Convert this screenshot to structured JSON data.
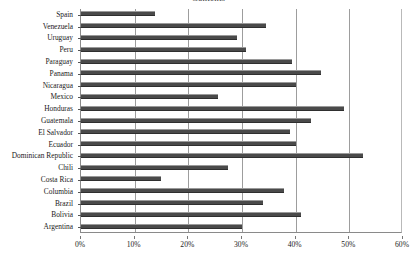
{
  "chart_data": {
    "type": "bar",
    "orientation": "horizontal",
    "title": "Contents",
    "xlabel": "",
    "ylabel": "",
    "xlim": [
      0,
      60
    ],
    "xticks": [
      "0%",
      "10%",
      "20%",
      "30%",
      "40%",
      "50%",
      "60%"
    ],
    "xtick_values": [
      0,
      10,
      20,
      30,
      40,
      50,
      60
    ],
    "grid": true,
    "gridlines_at": [
      10,
      20,
      30,
      40,
      50
    ],
    "legend": null,
    "bar_color": "#4a4a4a",
    "categories": [
      "Spain",
      "Venezuela",
      "Uruguay",
      "Peru",
      "Paraguay",
      "Panama",
      "Nicaragua",
      "Mexico",
      "Honduras",
      "Guatemala",
      "El Salvador",
      "Ecuador",
      "Dominican Republic",
      "Chili",
      "Costa Rica",
      "Columbia",
      "Brazil",
      "Bolivia",
      "Argentina"
    ],
    "values": [
      13.8,
      34.4,
      29.0,
      30.7,
      39.3,
      44.7,
      40.0,
      25.5,
      49.0,
      42.8,
      39.0,
      40.0,
      52.5,
      27.4,
      14.9,
      37.8,
      34.0,
      41.0,
      30.0
    ]
  }
}
